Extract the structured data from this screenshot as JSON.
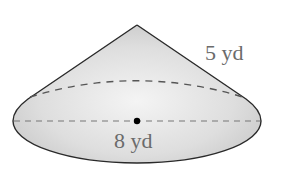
{
  "diagram": {
    "shape": "cone",
    "labels": {
      "slant_height": "5 yd",
      "base_diameter": "8 yd"
    },
    "colors": {
      "outline": "#2a2a2a",
      "fill": "#d6d6d6",
      "dash": "#555555",
      "label": "#6b6b6b",
      "center_dot": "#000000"
    }
  }
}
